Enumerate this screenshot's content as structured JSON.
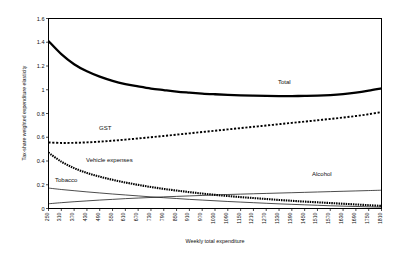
{
  "chart_data": {
    "type": "line",
    "title": "",
    "xlabel": "Weekly total expenditure",
    "ylabel": "Tax-share weighted expenditure elasticity",
    "ylim": [
      0,
      1.6
    ],
    "ytick_labels": [
      "0",
      "0.2",
      "0.4",
      "0.6",
      "0.8",
      "1",
      "1.2",
      "1.4",
      "1.6"
    ],
    "ytick_values": [
      0,
      0.2,
      0.4,
      0.6,
      0.8,
      1.0,
      1.2,
      1.4,
      1.6
    ],
    "grid": false,
    "legend_position": "inline-annotations",
    "categories": [
      250,
      310,
      370,
      430,
      490,
      550,
      610,
      670,
      730,
      790,
      850,
      910,
      970,
      1030,
      1090,
      1150,
      1210,
      1270,
      1330,
      1390,
      1450,
      1510,
      1570,
      1630,
      1690,
      1750,
      1810
    ],
    "series": [
      {
        "name": "Total",
        "style": "thick-solid",
        "values": [
          1.41,
          1.3,
          1.215,
          1.155,
          1.11,
          1.075,
          1.048,
          1.028,
          1.01,
          0.997,
          0.985,
          0.976,
          0.968,
          0.962,
          0.957,
          0.953,
          0.95,
          0.948,
          0.947,
          0.947,
          0.948,
          0.95,
          0.955,
          0.963,
          0.975,
          0.992,
          1.012
        ]
      },
      {
        "name": "GST",
        "style": "dotted",
        "values": [
          0.556,
          0.552,
          0.553,
          0.557,
          0.563,
          0.571,
          0.58,
          0.59,
          0.6,
          0.611,
          0.622,
          0.633,
          0.644,
          0.655,
          0.666,
          0.677,
          0.688,
          0.699,
          0.71,
          0.721,
          0.732,
          0.743,
          0.754,
          0.766,
          0.779,
          0.794,
          0.812
        ]
      },
      {
        "name": "Vehicle expenses",
        "style": "dotted-thick",
        "values": [
          0.47,
          0.395,
          0.34,
          0.3,
          0.268,
          0.242,
          0.219,
          0.199,
          0.181,
          0.165,
          0.151,
          0.138,
          0.126,
          0.115,
          0.105,
          0.096,
          0.088,
          0.08,
          0.072,
          0.065,
          0.058,
          0.052,
          0.046,
          0.04,
          0.034,
          0.028,
          0.022
        ]
      },
      {
        "name": "Tobacco",
        "style": "thin-solid",
        "values": [
          0.172,
          0.16,
          0.15,
          0.14,
          0.131,
          0.122,
          0.114,
          0.106,
          0.098,
          0.091,
          0.084,
          0.077,
          0.071,
          0.065,
          0.059,
          0.054,
          0.049,
          0.044,
          0.039,
          0.035,
          0.031,
          0.027,
          0.023,
          0.02,
          0.017,
          0.014,
          0.011
        ]
      },
      {
        "name": "Alcohol",
        "style": "thin-solid",
        "values": [
          0.04,
          0.049,
          0.057,
          0.064,
          0.071,
          0.077,
          0.083,
          0.088,
          0.093,
          0.098,
          0.102,
          0.106,
          0.11,
          0.114,
          0.118,
          0.121,
          0.124,
          0.127,
          0.13,
          0.133,
          0.136,
          0.139,
          0.142,
          0.145,
          0.148,
          0.151,
          0.154
        ]
      }
    ],
    "annotations": [
      {
        "text": "Total",
        "x": 278,
        "y": 84
      },
      {
        "text": "GST",
        "x": 99,
        "y": 130
      },
      {
        "text": "Vehicle expenses",
        "x": 86,
        "y": 162
      },
      {
        "text": "Tobacco",
        "x": 55,
        "y": 182
      },
      {
        "text": "Alcohol",
        "x": 312,
        "y": 176
      }
    ]
  }
}
